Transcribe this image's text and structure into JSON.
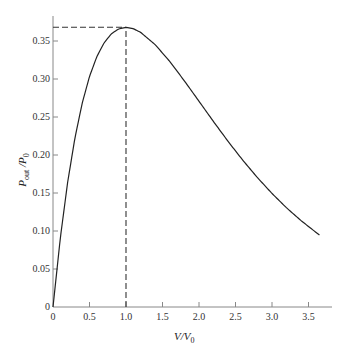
{
  "chart_data": {
    "type": "line",
    "title": "",
    "xlabel": "V/V0",
    "ylabel": "Pout / P0",
    "xlabel_parts": {
      "main": "V/V",
      "sub": "0"
    },
    "ylabel_parts": {
      "p1": "P",
      "sub1": "out",
      "sep": " /",
      "p2": "P",
      "sub2": "0"
    },
    "xlim": [
      0,
      3.8
    ],
    "ylim": [
      0,
      0.38
    ],
    "x_ticks": [
      0,
      0.5,
      1.0,
      1.5,
      2.0,
      2.5,
      3.0,
      3.5
    ],
    "x_tick_labels": [
      "0",
      "0.5",
      "1.0",
      "1.5",
      "2.0",
      "2.5",
      "3.0",
      "3.5"
    ],
    "y_ticks": [
      0,
      0.05,
      0.1,
      0.15,
      0.2,
      0.25,
      0.3,
      0.35
    ],
    "y_tick_labels": [
      "0",
      "0.05",
      "0.10",
      "0.15",
      "0.20",
      "0.25",
      "0.30",
      "0.35"
    ],
    "grid": false,
    "legend": null,
    "series": [
      {
        "name": "Pout/P0",
        "x": [
          0,
          0.1,
          0.2,
          0.3,
          0.4,
          0.5,
          0.6,
          0.7,
          0.8,
          0.9,
          1.0,
          1.1,
          1.2,
          1.4,
          1.6,
          1.8,
          2.0,
          2.2,
          2.4,
          2.6,
          2.8,
          3.0,
          3.2,
          3.4,
          3.6,
          3.65
        ],
        "values": [
          0,
          0.0905,
          0.1637,
          0.2222,
          0.2681,
          0.3033,
          0.3293,
          0.3476,
          0.3595,
          0.3659,
          0.3679,
          0.3662,
          0.3614,
          0.3452,
          0.323,
          0.2975,
          0.2707,
          0.2438,
          0.2177,
          0.1931,
          0.1703,
          0.1494,
          0.1304,
          0.1135,
          0.0984,
          0.0948
        ]
      }
    ],
    "annotations": [
      {
        "type": "dashed-hline",
        "y": 0.368,
        "x_from": 0,
        "x_to": 1.0
      },
      {
        "type": "dashed-vline",
        "x": 1.0,
        "y_from": 0,
        "y_to": 0.368
      }
    ]
  }
}
